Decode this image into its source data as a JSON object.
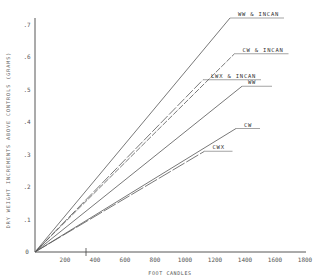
{
  "chart_data": {
    "type": "line",
    "title": "",
    "xlabel": "FOOT CANDLES",
    "ylabel": "DRY WEIGHT INCREMENTS ABOVE CONTROLS (GRAMS)",
    "xlim": [
      0,
      1800
    ],
    "ylim": [
      0,
      0.7
    ],
    "x_ticks": [
      200,
      400,
      600,
      800,
      1000,
      1200,
      1400,
      1600,
      1800
    ],
    "x_tick_labels": [
      "200",
      "400",
      "600",
      "800",
      "1000",
      "1200",
      "1400",
      "1600",
      "1800"
    ],
    "y_ticks": [
      0,
      0.1,
      0.2,
      0.3,
      0.4,
      0.5,
      0.6,
      0.7
    ],
    "y_tick_labels": [
      "0",
      ".1",
      ".2",
      ".3",
      ".4",
      ".5",
      ".6",
      ".7"
    ],
    "grid": false,
    "legend_position": "inline labels at line ends",
    "series": [
      {
        "name": "WW & INCAN",
        "x": [
          0,
          1300
        ],
        "y": [
          0,
          0.72
        ]
      },
      {
        "name": "CW & INCAN",
        "x": [
          0,
          1330
        ],
        "y": [
          0,
          0.61
        ]
      },
      {
        "name": "LWX & INCAN",
        "x": [
          0,
          1120
        ],
        "y": [
          0,
          0.53
        ]
      },
      {
        "name": "WW",
        "x": [
          0,
          1380
        ],
        "y": [
          0,
          0.51
        ]
      },
      {
        "name": "CW",
        "x": [
          0,
          1340
        ],
        "y": [
          0,
          0.38
        ]
      },
      {
        "name": "CWX",
        "x": [
          0,
          1130
        ],
        "y": [
          0,
          0.31
        ]
      }
    ]
  },
  "colors": {
    "axis": "#444444",
    "line": "#555555",
    "background": "#ffffff"
  }
}
